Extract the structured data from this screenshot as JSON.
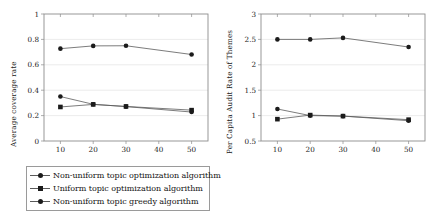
{
  "figure": {
    "background": "#ffffff",
    "line_color": "#5a5a5a",
    "marker_color": "#1b1b1b",
    "grid_color": "#e4e4e4",
    "axis_color": "#8d8d8d"
  },
  "legend_entries": [
    {
      "label": "Non-uniform topic optimization algorithm",
      "marker": "circle"
    },
    {
      "label": "Uniform topic optimization algorithm",
      "marker": "square"
    },
    {
      "label": "Non-uniform topic greedy algorithm",
      "marker": "circle"
    }
  ],
  "chart_data": [
    {
      "type": "line",
      "title": "",
      "xlabel": "",
      "ylabel": "Average coverage rate",
      "x": [
        10,
        20,
        30,
        40,
        50
      ],
      "categories": [
        "10",
        "20",
        "30",
        "40",
        "50"
      ],
      "xticklabels": [
        "10",
        "20",
        "30",
        "40",
        "50"
      ],
      "yticklabels": [
        "0",
        "0.2",
        "0.4",
        "0.6",
        "0.8",
        "1"
      ],
      "xlim": [
        5,
        55
      ],
      "ylim": [
        0,
        1
      ],
      "grid": true,
      "legend_position": "below",
      "series": [
        {
          "name": "Non-uniform topic optimization algorithm",
          "marker": "circle",
          "x": [
            10,
            20,
            30,
            50
          ],
          "values": [
            0.727,
            0.749,
            0.75,
            0.681
          ]
        },
        {
          "name": "Uniform topic optimization algorithm",
          "marker": "square",
          "x": [
            10,
            20,
            30,
            50
          ],
          "values": [
            0.268,
            0.288,
            0.272,
            0.243
          ]
        },
        {
          "name": "Non-uniform topic greedy algorithm",
          "marker": "circle",
          "x": [
            10,
            20,
            30,
            50
          ],
          "values": [
            0.35,
            0.289,
            0.271,
            0.228
          ]
        }
      ]
    },
    {
      "type": "line",
      "title": "",
      "xlabel": "",
      "ylabel": "Per Capita Audit Rate of Themes",
      "x": [
        10,
        20,
        30,
        40,
        50
      ],
      "categories": [
        "10",
        "20",
        "30",
        "40",
        "50"
      ],
      "xticklabels": [
        "10",
        "20",
        "30",
        "40",
        "50"
      ],
      "yticklabels": [
        "0.5",
        "1",
        "1.5",
        "2",
        "2.5",
        "3"
      ],
      "xlim": [
        5,
        55
      ],
      "ylim": [
        0.5,
        3
      ],
      "grid": true,
      "legend_position": "below",
      "series": [
        {
          "name": "Non-uniform topic optimization algorithm",
          "marker": "circle",
          "x": [
            10,
            20,
            30,
            50
          ],
          "values": [
            2.5,
            2.5,
            2.53,
            2.35
          ]
        },
        {
          "name": "Uniform topic optimization algorithm",
          "marker": "square",
          "x": [
            10,
            20,
            30,
            50
          ],
          "values": [
            0.93,
            1.01,
            0.99,
            0.92
          ]
        },
        {
          "name": "Non-uniform topic greedy algorithm",
          "marker": "circle",
          "x": [
            10,
            20,
            30,
            50
          ],
          "values": [
            1.13,
            1.0,
            0.99,
            0.9
          ]
        }
      ]
    }
  ]
}
